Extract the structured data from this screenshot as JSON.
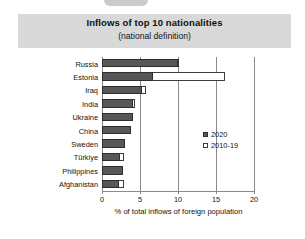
{
  "chart_data": {
    "type": "bar",
    "orientation": "horizontal",
    "title": "Inflows of top 10 nationalities",
    "subtitle": "(national definition)",
    "xlabel": "% of total inflows of foreign population",
    "ylabel": "",
    "xlim": [
      0,
      20
    ],
    "xticks": [
      "0",
      "5",
      "10",
      "15",
      "20"
    ],
    "xtick_values": [
      0,
      5,
      10,
      15,
      20
    ],
    "grid": true,
    "legend_position": "middle-right",
    "categories": [
      "Russia",
      "Estonia",
      "Iraq",
      "India",
      "Ukraine",
      "China",
      "Sweden",
      "Türkiye",
      "Philippines",
      "Afghanistan"
    ],
    "series": [
      {
        "name": "2020",
        "style": "filled",
        "color": "#575757",
        "values": [
          10.0,
          6.7,
          5.3,
          4.1,
          4.1,
          3.8,
          3.0,
          2.4,
          2.8,
          2.2
        ]
      },
      {
        "name": "2010-19",
        "style": "open",
        "color": "#ffffff",
        "values": [
          10.1,
          16.2,
          5.8,
          4.3,
          4.1,
          3.8,
          3.0,
          2.9,
          2.8,
          2.9
        ]
      }
    ]
  },
  "legend": {
    "entries": [
      {
        "label": "2020",
        "swatch": "filled-square-icon"
      },
      {
        "label": "2010-19",
        "swatch": "open-square-icon"
      }
    ]
  },
  "colors": {
    "series_2020": "#575757",
    "series_2010_19": "#ffffff",
    "outline": "#3d3d3d",
    "grid": "#8a8a8a",
    "title_band": "#d9d9d9",
    "background": "#ffffff"
  }
}
